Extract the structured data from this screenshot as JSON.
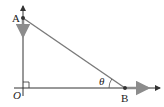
{
  "diagram": {
    "type": "right-triangle-motion",
    "labels": {
      "point_a": "A",
      "point_b": "B",
      "origin": "O",
      "angle": "θ"
    },
    "elements": [
      "vertical axis through O with arrowhead at top",
      "horizontal axis through O with arrowhead at right",
      "segment AB (hypotenuse)",
      "right-angle marker at O",
      "angle θ at B between AB and the horizontal axis",
      "downward velocity arrow at A",
      "rightward velocity arrow at B"
    ],
    "colors": {
      "axis": "#333333",
      "hypotenuse": "#7a7a7a",
      "velocity_arrow": "#8c8c8c",
      "point": "#333333"
    }
  }
}
